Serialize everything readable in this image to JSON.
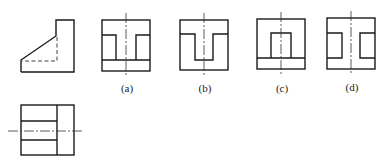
{
  "figure": {
    "title": "",
    "given_views": [
      {
        "id": "left-view",
        "description": "Side (left) view: L-shaped profile with inclined face and hidden lines"
      },
      {
        "id": "top-view",
        "description": "Top view: rectangle divided by horizontal lines with horizontal centerline"
      }
    ],
    "options": [
      {
        "label": "(a)",
        "description": "Front view with two side pockets at top and bottom strip"
      },
      {
        "label": "(b)",
        "description": "Front view with T-shaped slot"
      },
      {
        "label": "(c)",
        "description": "Front view with central rectangular pocket above bottom strip"
      },
      {
        "label": "(d)",
        "description": "Front view with two side pockets at middle height"
      }
    ]
  },
  "colors": {
    "line": "#1a1a1a",
    "background": "#ffffff"
  }
}
